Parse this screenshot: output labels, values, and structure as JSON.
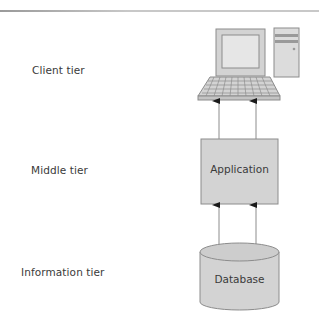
{
  "diagram": {
    "type": "three-tier-architecture",
    "tiers": [
      {
        "label": "Client tier",
        "component": "computer",
        "icon": "desktop-computer-icon"
      },
      {
        "label": "Middle tier",
        "component": "Application",
        "shape": "box"
      },
      {
        "label": "Information tier",
        "component": "Database",
        "shape": "cylinder"
      }
    ],
    "connections": [
      {
        "from": "Application",
        "to": "computer",
        "arrows": 2,
        "direction": "up"
      },
      {
        "from": "Database",
        "to": "Application",
        "arrows": 2,
        "direction": "up"
      }
    ],
    "colors": {
      "fill": "#d3d3d3",
      "stroke": "#8c8c8c",
      "screen": "#e8e8e8",
      "text": "#3a3a3a",
      "arrow": "#1a1a1a",
      "rule": "#b4b4b4"
    }
  },
  "labels": {
    "client_tier": "Client tier",
    "middle_tier": "Middle tier",
    "information_tier": "Information tier",
    "application_box": "Application",
    "database_cylinder": "Database"
  }
}
